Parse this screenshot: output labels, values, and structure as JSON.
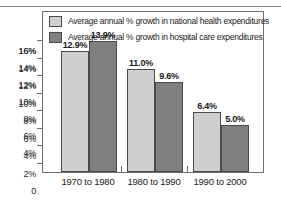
{
  "chart_data": {
    "type": "bar",
    "title": "",
    "xlabel": "",
    "ylabel": "",
    "categories": [
      "1970 to 1980",
      "1980 to 1990",
      "1990 to 2000"
    ],
    "series": [
      {
        "name": "Average annual % growth in national health expenditures",
        "color": "#cfcfcf",
        "values": [
          12.9,
          11.0,
          6.4
        ],
        "labels": [
          "12.9%",
          "11.0%",
          "6.4%"
        ]
      },
      {
        "name": "Average annual % growth in hospital care expenditures",
        "color": "#808080",
        "values": [
          13.9,
          9.6,
          5.0
        ],
        "labels": [
          "13.9%",
          "9.6%",
          "5.0%"
        ]
      }
    ],
    "ylim": [
      0,
      17
    ],
    "y_ticks": [
      16,
      14,
      12,
      10,
      8,
      6,
      4,
      2,
      0
    ],
    "y_tick_labels": [
      "16%",
      "14%",
      "12%",
      "10%",
      "8%",
      "6%",
      "4%",
      "2%",
      "0"
    ],
    "grid": false,
    "legend_position": "top-inside"
  },
  "legend": {
    "items": [
      {
        "label": "Average annual % growth in national health expenditures",
        "swatch": "light-gray-swatch"
      },
      {
        "label": "Average annual % growth in hospital care expenditures",
        "swatch": "dark-gray-swatch"
      }
    ]
  },
  "colors": {
    "series_light": "#cfcfcf",
    "series_dark": "#808080",
    "frame": "#6e6e6e",
    "text": "#1a1a1a",
    "background": "#ffffff"
  }
}
